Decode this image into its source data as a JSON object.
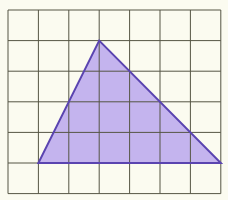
{
  "diagram": {
    "type": "grid-with-triangle",
    "grid": {
      "cols": 7,
      "rows": 6,
      "left": 8,
      "top": 10,
      "cell_w": 30.4,
      "cell_h": 30.6,
      "line_color": "#555544"
    },
    "triangle": {
      "vertices_grid": [
        [
          3,
          1
        ],
        [
          1,
          5
        ],
        [
          7,
          5
        ]
      ],
      "fill": "#c4b4ee",
      "stroke": "#5a44b0"
    },
    "background": "#fbfbf0"
  }
}
